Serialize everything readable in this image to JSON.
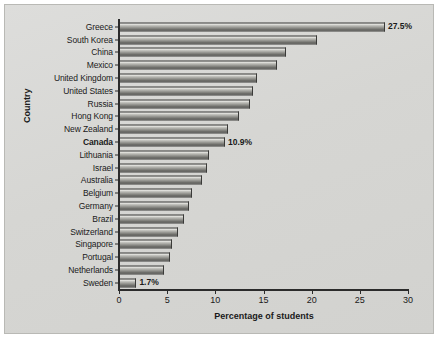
{
  "chart_data": {
    "type": "bar",
    "orientation": "horizontal",
    "title": "",
    "xlabel": "Percentage of students",
    "ylabel": "Country",
    "xlim": [
      0,
      30
    ],
    "xticks": [
      0,
      5,
      10,
      15,
      20,
      25,
      30
    ],
    "grid": false,
    "legend": null,
    "categories": [
      "Greece",
      "South Korea",
      "China",
      "Mexico",
      "United Kingdom",
      "United States",
      "Russia",
      "Hong Kong",
      "New Zealand",
      "Canada",
      "Lithuania",
      "Israel",
      "Australia",
      "Belgium",
      "Germany",
      "Brazil",
      "Switzerland",
      "Singapore",
      "Portugal",
      "Netherlands",
      "Sweden"
    ],
    "values": [
      27.5,
      20.4,
      17.2,
      16.3,
      14.2,
      13.8,
      13.5,
      12.4,
      11.2,
      10.9,
      9.2,
      9.0,
      8.5,
      7.5,
      7.2,
      6.6,
      6.0,
      5.4,
      5.2,
      4.6,
      1.7
    ],
    "bars": [
      {
        "label": "Greece",
        "value": 27.5,
        "value_label": "27.5%",
        "highlight": false
      },
      {
        "label": "South Korea",
        "value": 20.4,
        "value_label": "",
        "highlight": false
      },
      {
        "label": "China",
        "value": 17.2,
        "value_label": "",
        "highlight": false
      },
      {
        "label": "Mexico",
        "value": 16.3,
        "value_label": "",
        "highlight": false
      },
      {
        "label": "United Kingdom",
        "value": 14.2,
        "value_label": "",
        "highlight": false
      },
      {
        "label": "United States",
        "value": 13.8,
        "value_label": "",
        "highlight": false
      },
      {
        "label": "Russia",
        "value": 13.5,
        "value_label": "",
        "highlight": false
      },
      {
        "label": "Hong Kong",
        "value": 12.4,
        "value_label": "",
        "highlight": false
      },
      {
        "label": "New Zealand",
        "value": 11.2,
        "value_label": "",
        "highlight": false
      },
      {
        "label": "Canada",
        "value": 10.9,
        "value_label": "10.9%",
        "highlight": true
      },
      {
        "label": "Lithuania",
        "value": 9.2,
        "value_label": "",
        "highlight": false
      },
      {
        "label": "Israel",
        "value": 9.0,
        "value_label": "",
        "highlight": false
      },
      {
        "label": "Australia",
        "value": 8.5,
        "value_label": "",
        "highlight": false
      },
      {
        "label": "Belgium",
        "value": 7.5,
        "value_label": "",
        "highlight": false
      },
      {
        "label": "Germany",
        "value": 7.2,
        "value_label": "",
        "highlight": false
      },
      {
        "label": "Brazil",
        "value": 6.6,
        "value_label": "",
        "highlight": false
      },
      {
        "label": "Switzerland",
        "value": 6.0,
        "value_label": "",
        "highlight": false
      },
      {
        "label": "Singapore",
        "value": 5.4,
        "value_label": "",
        "highlight": false
      },
      {
        "label": "Portugal",
        "value": 5.2,
        "value_label": "",
        "highlight": false
      },
      {
        "label": "Netherlands",
        "value": 4.6,
        "value_label": "",
        "highlight": false
      },
      {
        "label": "Sweden",
        "value": 1.7,
        "value_label": "1.7%",
        "highlight": false
      }
    ],
    "colors": {
      "panel_background": "#d9d9d6",
      "bar_light": "#efefec",
      "bar_dark": "#585854",
      "bar_outline": "#3a3a38",
      "axis": "#2b2b2b",
      "text": "#1a1a1a"
    }
  }
}
